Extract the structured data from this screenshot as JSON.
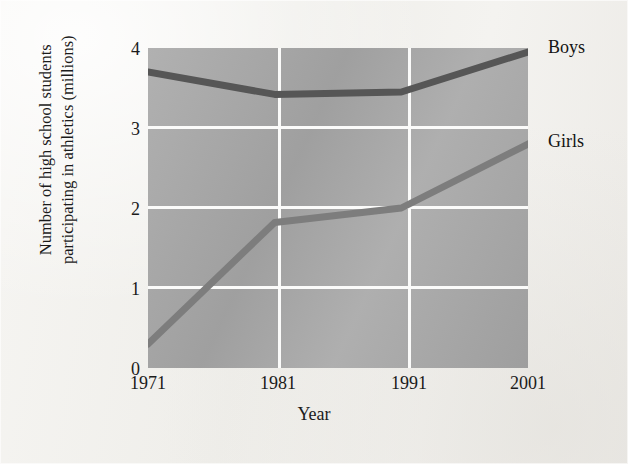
{
  "figure": {
    "background_color": "#f3f2ef",
    "plot_fill_color": "#a8a8a8",
    "gridline_color": "#fbfbfa"
  },
  "axes": {
    "y_title_line1": "Number of high school students",
    "y_title_line2": "participating in athletics (millions)",
    "x_title": "Year",
    "y_ticks": [
      "0",
      "1",
      "2",
      "3",
      "4"
    ],
    "x_ticks": [
      "1971",
      "1981",
      "1991",
      "2001"
    ]
  },
  "labels": {
    "boys": "Boys",
    "girls": "Girls"
  },
  "chart_data": {
    "type": "line",
    "title": "",
    "xlabel": "Year",
    "ylabel": "Number of high school students participating in athletics (millions)",
    "x": [
      1971,
      1981,
      1991,
      2001
    ],
    "xtick_labels": [
      "1971",
      "1981",
      "1991",
      "2001"
    ],
    "ytick_labels": [
      "0",
      "1",
      "2",
      "3",
      "4"
    ],
    "xlim": [
      1971,
      2001
    ],
    "ylim": [
      0,
      4
    ],
    "grid": true,
    "legend_position": "right-end-labels",
    "series": [
      {
        "name": "Boys",
        "color": "#565656",
        "values": [
          3.7,
          3.42,
          3.45,
          3.95
        ]
      },
      {
        "name": "Girls",
        "color": "#7d7d7d",
        "values": [
          0.3,
          1.82,
          2.0,
          2.8
        ]
      }
    ]
  }
}
